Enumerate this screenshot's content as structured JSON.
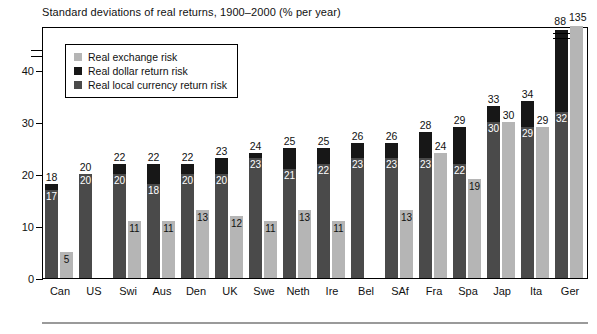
{
  "chart_data": {
    "type": "bar",
    "title": "Standard deviations of real returns, 1900–2000 (% per year)",
    "xlabel": "",
    "ylabel": "",
    "ylim": [
      0,
      45
    ],
    "yticks": [
      0,
      10,
      20,
      30,
      40
    ],
    "grid": false,
    "axis_break": true,
    "axis_break_note": "y-axis is broken above 40; Ger bars (88 and 135) are truncated",
    "legend_position": "upper-left inside plot",
    "legend": [
      {
        "label": "Real exchange risk",
        "color": "#b5b5b5"
      },
      {
        "label": "Real dollar return risk",
        "color": "#171717"
      },
      {
        "label": "Real local currency return risk",
        "color": "#4a4a4a"
      }
    ],
    "categories": [
      "Can",
      "US",
      "Swi",
      "Aus",
      "Den",
      "UK",
      "Swe",
      "Neth",
      "Ire",
      "Bel",
      "SAf",
      "Fra",
      "Spa",
      "Jap",
      "Ita",
      "Ger"
    ],
    "series": [
      {
        "name": "Real dollar return risk",
        "note": "total height of the left (dark) bar; top black segment",
        "values": [
          18,
          20,
          22,
          22,
          22,
          23,
          24,
          25,
          25,
          26,
          26,
          28,
          29,
          33,
          34,
          88
        ]
      },
      {
        "name": "Real local currency return risk",
        "note": "lower dark-grey segment of the left bar",
        "values": [
          17,
          20,
          20,
          18,
          20,
          20,
          23,
          21,
          22,
          23,
          23,
          23,
          22,
          30,
          29,
          32
        ]
      },
      {
        "name": "Real exchange risk",
        "note": "right-hand light-grey bar",
        "values": [
          5,
          null,
          11,
          11,
          13,
          12,
          11,
          13,
          11,
          null,
          13,
          11,
          19,
          30,
          29,
          135
        ]
      }
    ],
    "bars": [
      {
        "category": "Can",
        "total": 18,
        "local": 17,
        "exchange": 5,
        "total_label": "18",
        "local_label": "17",
        "exchange_label": "5",
        "truncated": false
      },
      {
        "category": "US",
        "total": 20,
        "local": 20,
        "exchange": null,
        "total_label": "20",
        "local_label": "20",
        "exchange_label": "",
        "truncated": false
      },
      {
        "category": "Swi",
        "total": 22,
        "local": 20,
        "exchange": 11,
        "total_label": "22",
        "local_label": "20",
        "exchange_label": "11",
        "truncated": false
      },
      {
        "category": "Aus",
        "total": 22,
        "local": 18,
        "exchange": 11,
        "total_label": "22",
        "local_label": "18",
        "exchange_label": "11",
        "truncated": false
      },
      {
        "category": "Den",
        "total": 22,
        "local": 20,
        "exchange": 13,
        "total_label": "22",
        "local_label": "20",
        "exchange_label": "13",
        "truncated": false
      },
      {
        "category": "UK",
        "total": 23,
        "local": 20,
        "exchange": 12,
        "total_label": "23",
        "local_label": "20",
        "exchange_label": "12",
        "truncated": false
      },
      {
        "category": "Swe",
        "total": 24,
        "local": 23,
        "exchange": 11,
        "total_label": "24",
        "local_label": "23",
        "exchange_label": "11",
        "truncated": false
      },
      {
        "category": "Neth",
        "total": 25,
        "local": 21,
        "exchange": 13,
        "total_label": "25",
        "local_label": "21",
        "exchange_label": "13",
        "truncated": false
      },
      {
        "category": "Ire",
        "total": 25,
        "local": 22,
        "exchange": 11,
        "total_label": "25",
        "local_label": "22",
        "exchange_label": "11",
        "truncated": false
      },
      {
        "category": "Bel",
        "total": 26,
        "local": 23,
        "exchange": null,
        "total_label": "26",
        "local_label": "23",
        "exchange_label": "",
        "truncated": false
      },
      {
        "category": "SAf",
        "total": 26,
        "local": 23,
        "exchange": 13,
        "total_label": "26",
        "local_label": "23",
        "exchange_label": "13",
        "truncated": false
      },
      {
        "category": "Fra",
        "total": 28,
        "local": 23,
        "exchange": 24,
        "total_label": "28",
        "local_label": "23",
        "exchange_label": "24",
        "truncated": false
      },
      {
        "category": "Spa",
        "total": 29,
        "local": 22,
        "exchange": 19,
        "total_label": "29",
        "local_label": "22",
        "exchange_label": "19",
        "truncated": false
      },
      {
        "category": "Jap",
        "total": 33,
        "local": 30,
        "exchange": 30,
        "total_label": "33",
        "local_label": "30",
        "exchange_label": "30",
        "truncated": false
      },
      {
        "category": "Ita",
        "total": 34,
        "local": 29,
        "exchange": 29,
        "total_label": "34",
        "local_label": "29",
        "exchange_label": "29",
        "truncated": false
      },
      {
        "category": "Ger",
        "total": 88,
        "local": 32,
        "exchange": 135,
        "total_label": "88",
        "local_label": "32",
        "exchange_label": "135",
        "truncated": true
      }
    ]
  },
  "colors": {
    "exchange": "#b5b5b5",
    "dollar": "#171717",
    "local": "#4a4a4a",
    "axis": "#000000",
    "footer_rule": "#9a9a9a"
  }
}
